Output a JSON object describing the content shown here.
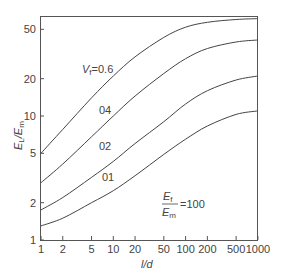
{
  "chart_data": {
    "type": "line",
    "title": "",
    "xlabel": "l/d",
    "ylabel": "E_L / E_m",
    "xscale": "log",
    "yscale": "log",
    "xlim": [
      1,
      1000
    ],
    "ylim": [
      1,
      65
    ],
    "grid": false,
    "legend_position": "inline",
    "x_ticks": [
      1,
      2,
      5,
      10,
      20,
      50,
      100,
      200,
      500,
      1000
    ],
    "x_tick_labels": [
      "1",
      "2",
      "5",
      "10",
      "20",
      "50",
      "100",
      "200",
      "500",
      "1000"
    ],
    "y_ticks": [
      1,
      2,
      5,
      10,
      20,
      50
    ],
    "y_tick_labels": [
      "1",
      "2",
      "5",
      "10",
      "20",
      "50"
    ],
    "x": [
      1,
      2,
      5,
      10,
      20,
      50,
      100,
      200,
      500,
      1000
    ],
    "series": [
      {
        "name": "Vf = 0.6",
        "label": "V_f = 0.6",
        "values": [
          5.0,
          7.8,
          14.0,
          21.0,
          30.0,
          43.0,
          52.0,
          57.0,
          60.0,
          61.0
        ]
      },
      {
        "name": "Vf = 0.4",
        "label": "0.4",
        "values": [
          2.9,
          4.1,
          6.8,
          10.0,
          14.5,
          22.0,
          29.0,
          35.0,
          39.5,
          41.0
        ]
      },
      {
        "name": "Vf = 0.2",
        "label": "0.2",
        "values": [
          1.75,
          2.2,
          3.2,
          4.3,
          6.0,
          9.0,
          12.5,
          16.0,
          19.5,
          21.0
        ]
      },
      {
        "name": "Vf = 0.1",
        "label": "0.1",
        "values": [
          1.3,
          1.5,
          2.0,
          2.5,
          3.3,
          4.9,
          6.5,
          8.3,
          10.3,
          11.0
        ]
      }
    ],
    "annotations": [
      {
        "text": "E_f / E_m = 100",
        "x": 200,
        "y": 1.8
      }
    ]
  },
  "labels": {
    "xlabel": "l/d",
    "ylabel_main": "E",
    "ylabel_sub_L": "L",
    "ylabel_slash": "/",
    "ylabel_sub_m": "m",
    "vf_prefix": "V",
    "vf_sub": "f",
    "vf_eq": "=0.6",
    "c04": "04",
    "c02": "02",
    "c01": "01",
    "ratio_num": "E",
    "ratio_num_sub": "f",
    "ratio_den": "E",
    "ratio_den_sub": "m",
    "ratio_value": "=100"
  }
}
